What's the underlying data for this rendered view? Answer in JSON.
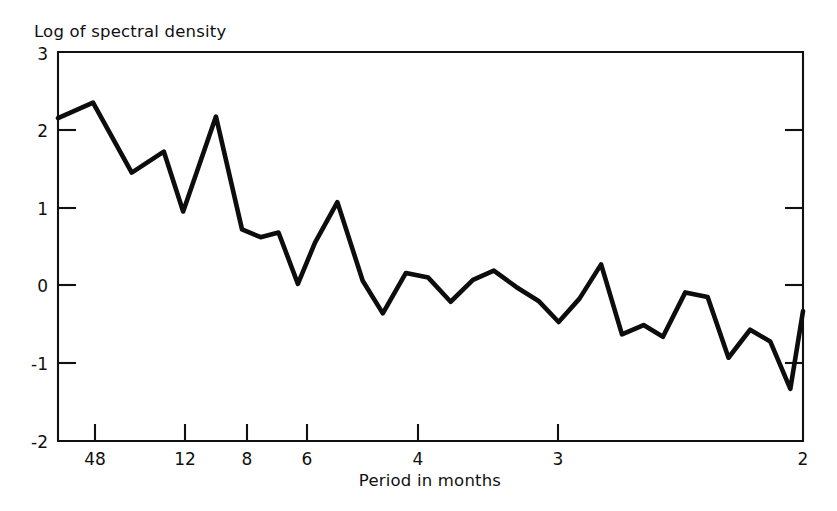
{
  "figure": {
    "background": "#ffffff",
    "ink_color": "#111111",
    "line_color": "#0d0d0d"
  },
  "chart_data": {
    "type": "line",
    "title": "",
    "subtitle": "",
    "ylabel": "Log of spectral density",
    "xlabel": "Period in months",
    "ylim": [
      -2,
      3
    ],
    "yticks": [
      -2,
      -1,
      0,
      1,
      2,
      3
    ],
    "ytick_labels": [
      "-2",
      "-1",
      "0",
      "1",
      "2",
      "3"
    ],
    "xticks": [
      48,
      12,
      8,
      6,
      4,
      3,
      2
    ],
    "xtick_labels": [
      "48",
      "12",
      "8",
      "6",
      "4",
      "3",
      "2"
    ],
    "x_axis_note": "period in months, decreasing left to right (linear in frequency)",
    "grid": false,
    "legend": null,
    "series": [
      {
        "name": "log spectral density",
        "x_pixel_frac": [
          0.0,
          0.047,
          0.099,
          0.142,
          0.168,
          0.212,
          0.247,
          0.272,
          0.296,
          0.322,
          0.345,
          0.375,
          0.409,
          0.436,
          0.467,
          0.497,
          0.527,
          0.557,
          0.585,
          0.615,
          0.645,
          0.672,
          0.7,
          0.729,
          0.757,
          0.786,
          0.812,
          0.842,
          0.872,
          0.9,
          0.929,
          0.956,
          0.983,
          1.0
        ],
        "values": [
          2.15,
          2.35,
          1.45,
          1.72,
          0.95,
          2.17,
          0.72,
          0.62,
          0.68,
          0.02,
          0.55,
          1.07,
          0.06,
          -0.36,
          0.16,
          0.1,
          -0.21,
          0.07,
          0.19,
          -0.02,
          -0.2,
          -0.47,
          -0.17,
          0.27,
          -0.63,
          -0.51,
          -0.66,
          -0.09,
          -0.15,
          -0.93,
          -0.57,
          -0.72,
          -1.33,
          -0.33
        ]
      }
    ]
  },
  "axes": {
    "y_title": "Log of spectral density",
    "x_title": "Period in months"
  }
}
